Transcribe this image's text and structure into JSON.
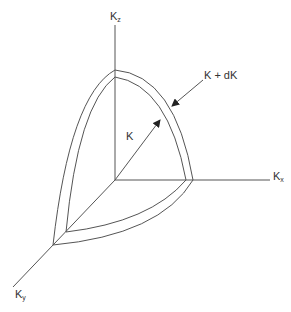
{
  "diagram": {
    "title": "",
    "axes": {
      "kz": {
        "label": "K",
        "subscript": "z"
      },
      "kx": {
        "label": "K",
        "subscript": "x"
      },
      "ky": {
        "label": "K",
        "subscript": "y"
      }
    },
    "annotations": {
      "inner_radius": "K",
      "outer_radius": "K + dK"
    },
    "colors": {
      "stroke": "#555555",
      "text": "#333333",
      "background": "#ffffff"
    }
  }
}
